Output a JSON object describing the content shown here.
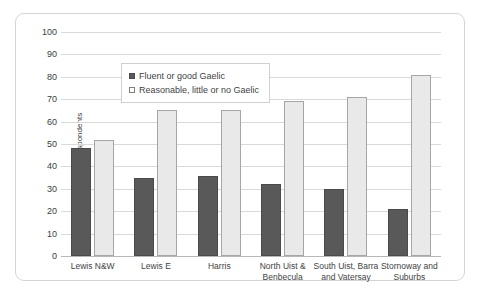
{
  "chart_data": {
    "type": "bar",
    "title": "",
    "xlabel": "",
    "ylabel": "% of respondents",
    "ylim": [
      0,
      100
    ],
    "yticks": [
      0,
      10,
      20,
      30,
      40,
      50,
      60,
      70,
      80,
      90,
      100
    ],
    "grid": true,
    "legend_position": "top-left inside plot",
    "categories": [
      "Lewis N&W",
      "Lewis E",
      "Harris",
      "North Uist & Benbecula",
      "South Uist, Barra and Vatersay",
      "Stornoway and Suburbs"
    ],
    "category_lines": [
      [
        "Lewis N&W"
      ],
      [
        "Lewis E"
      ],
      [
        "Harris"
      ],
      [
        "North Uist &",
        "Benbecula"
      ],
      [
        "South Uist, Barra",
        "and Vatersay"
      ],
      [
        "Stornoway and",
        "Suburbs"
      ]
    ],
    "series": [
      {
        "name": "Fluent or good Gaelic",
        "color": "#595959",
        "values": [
          48,
          35,
          35.5,
          32,
          30,
          21
        ]
      },
      {
        "name": "Reasonable, little or no Gaelic",
        "color": "#e9e9e9",
        "values": [
          52,
          65,
          65,
          69,
          71,
          81
        ]
      }
    ]
  }
}
